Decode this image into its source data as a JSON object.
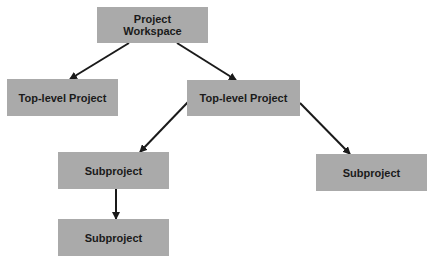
{
  "diagram": {
    "colors": {
      "node_fill": "#aaaaaa",
      "text": "#1a1a1a",
      "arrow": "#1a1a1a",
      "background": "#ffffff"
    },
    "nodes": [
      {
        "id": "workspace",
        "label": "Project\nWorkspace",
        "x": 97,
        "y": 7,
        "w": 111,
        "h": 36
      },
      {
        "id": "top-level-left",
        "label": "Top-level Project",
        "x": 7,
        "y": 79,
        "w": 111,
        "h": 37
      },
      {
        "id": "top-level-right",
        "label": "Top-level Project",
        "x": 187,
        "y": 80,
        "w": 113,
        "h": 36
      },
      {
        "id": "subproject-a",
        "label": "Subproject",
        "x": 58,
        "y": 152,
        "w": 111,
        "h": 37
      },
      {
        "id": "subproject-a-child",
        "label": "Subproject",
        "x": 58,
        "y": 219,
        "w": 111,
        "h": 37
      },
      {
        "id": "subproject-b",
        "label": "Subproject",
        "x": 316,
        "y": 154,
        "w": 111,
        "h": 37
      }
    ],
    "edges": [
      {
        "from": "workspace",
        "to": "top-level-left",
        "x1": 129,
        "y1": 43,
        "x2": 70,
        "y2": 79
      },
      {
        "from": "workspace",
        "to": "top-level-right",
        "x1": 177,
        "y1": 43,
        "x2": 236,
        "y2": 80
      },
      {
        "from": "top-level-right",
        "to": "subproject-a",
        "x1": 188,
        "y1": 102,
        "x2": 140,
        "y2": 152
      },
      {
        "from": "top-level-right",
        "to": "subproject-b",
        "x1": 300,
        "y1": 103,
        "x2": 350,
        "y2": 154
      },
      {
        "from": "subproject-a",
        "to": "subproject-a-child",
        "x1": 116,
        "y1": 189,
        "x2": 116,
        "y2": 219
      }
    ]
  }
}
